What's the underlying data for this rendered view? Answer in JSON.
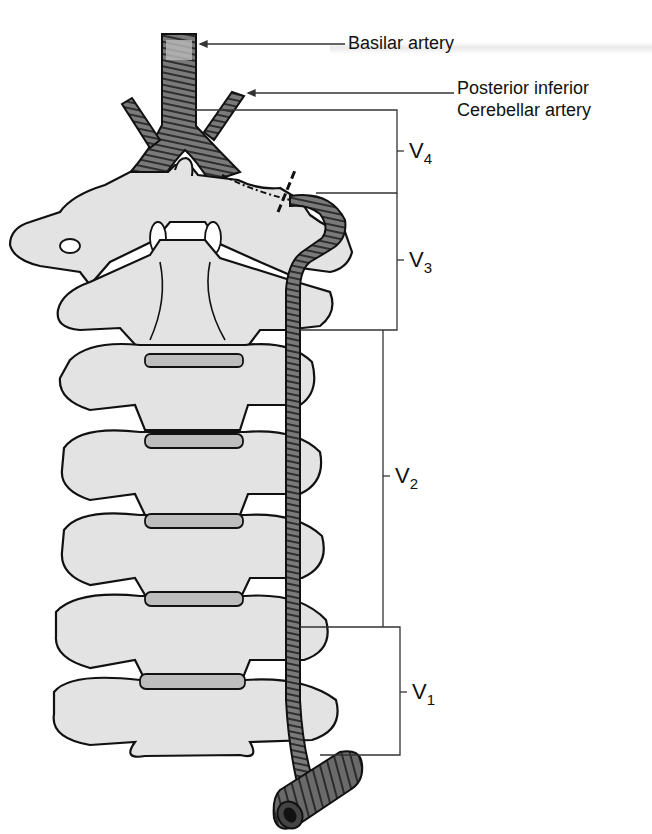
{
  "figure": {
    "labels": {
      "basilar": "Basilar artery",
      "pica_line1": "Posterior inferior",
      "pica_line2": "Cerebellar artery"
    },
    "segments": [
      {
        "id": "V4",
        "letter": "V",
        "sub": "4"
      },
      {
        "id": "V3",
        "letter": "V",
        "sub": "3"
      },
      {
        "id": "V2",
        "letter": "V",
        "sub": "2"
      },
      {
        "id": "V1",
        "letter": "V",
        "sub": "1"
      }
    ],
    "colors": {
      "bone": "#e3e3e3",
      "outline": "#111111",
      "artery": "#6e6e6e",
      "artery_light": "#9a9a9a",
      "disc": "#bdbdbd",
      "leader": "#333333"
    }
  }
}
